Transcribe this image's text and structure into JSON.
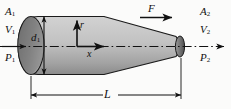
{
  "figure": {
    "background_color": "#fbfbfa",
    "line_color": "#111111",
    "body_fill_light": "#c8c8c8",
    "body_fill_dark": "#8f8f8f",
    "nose_fill": "#6e6e6e",
    "tail_fill": "#5c5c5c"
  },
  "labels": {
    "inlet_area": "A",
    "inlet_area_sub": "1",
    "inlet_velocity": "V",
    "inlet_velocity_sub": "1",
    "inlet_pressure": "P",
    "inlet_pressure_sub": "1",
    "outlet_area": "A",
    "outlet_area_sub": "2",
    "outlet_velocity": "V",
    "outlet_velocity_sub": "2",
    "outlet_pressure": "P",
    "outlet_pressure_sub": "2",
    "force": "F",
    "diameter": "d",
    "diameter_sub": "1",
    "length": "L",
    "axis_radial": "r",
    "axis_longitudinal": "x"
  },
  "annotations": {
    "flow_direction": "left-to-right",
    "centerline_style": "dash-dot",
    "diameter_dimension": "vertical double-arrow at inlet",
    "length_dimension": "horizontal double-arrow below body",
    "force_arrow_direction": "right",
    "radial_axis_direction": "up",
    "longitudinal_axis_direction": "right"
  }
}
